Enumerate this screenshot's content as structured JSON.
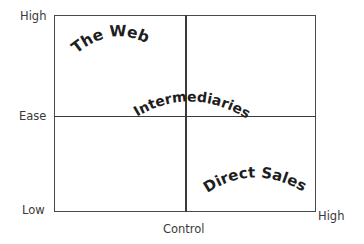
{
  "diagram": {
    "y_axis": {
      "title": "Ease",
      "high_label": "High",
      "low_label": "Low"
    },
    "x_axis": {
      "title": "Control",
      "high_label": "High"
    },
    "quadrant_labels": {
      "top_left": "The Web",
      "center": "Intermediaries",
      "bottom_right": "Direct Sales"
    },
    "colors": {
      "line": "#3a3a3a",
      "text": "#1e1e1e",
      "background": "#ffffff"
    }
  }
}
